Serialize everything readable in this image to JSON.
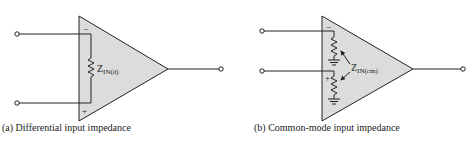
{
  "diagrams": [
    {
      "id": "a",
      "caption": "(a) Differential input impedance",
      "label_main": "Z",
      "label_sub": "IN(d)",
      "minus_sign": "−",
      "plus_sign": "+"
    },
    {
      "id": "b",
      "caption": "(b) Common-mode input impedance",
      "label_main": "Z",
      "label_sub": "IN(cm)",
      "minus_sign": "−",
      "plus_sign": "+"
    }
  ],
  "colors": {
    "triangle_fill": "#dcdcdc",
    "stroke": "#222222"
  }
}
